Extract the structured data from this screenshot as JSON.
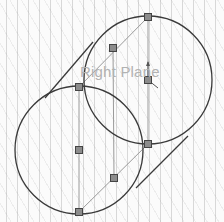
{
  "viewport": {
    "plane_label": "Right Plane",
    "colors": {
      "sketch_line": "#3a3a3a",
      "construction_line": "#9a9a9a",
      "point_fill": "#8c8c8c",
      "point_stroke": "#444444",
      "label": "#b2b2b2"
    }
  },
  "sketch": {
    "circles": [
      {
        "name": "upper-right-circle",
        "cx": 148,
        "cy": 80,
        "r": 64
      },
      {
        "name": "lower-left-circle",
        "cx": 79,
        "cy": 150,
        "r": 64
      }
    ],
    "tangent_lines": [
      {
        "x1": 45,
        "y1": 98,
        "x2": 93,
        "y2": 42
      },
      {
        "x1": 136,
        "y1": 188,
        "x2": 188,
        "y2": 136
      }
    ],
    "construction_lines": [
      {
        "x1": 148,
        "y1": 17,
        "x2": 148,
        "y2": 144
      },
      {
        "x1": 79,
        "y1": 87,
        "x2": 79,
        "y2": 212
      },
      {
        "x1": 148,
        "y1": 17,
        "x2": 79,
        "y2": 87
      },
      {
        "x1": 148,
        "y1": 144,
        "x2": 79,
        "y2": 212
      },
      {
        "x1": 113,
        "y1": 48,
        "x2": 114,
        "y2": 178
      }
    ],
    "points": [
      {
        "x": 148,
        "y": 17
      },
      {
        "x": 113,
        "y": 48
      },
      {
        "x": 148,
        "y": 80
      },
      {
        "x": 79,
        "y": 87
      },
      {
        "x": 148,
        "y": 144
      },
      {
        "x": 79,
        "y": 150
      },
      {
        "x": 114,
        "y": 178
      },
      {
        "x": 79,
        "y": 212
      }
    ],
    "origin": {
      "x": 148,
      "y": 80
    }
  }
}
